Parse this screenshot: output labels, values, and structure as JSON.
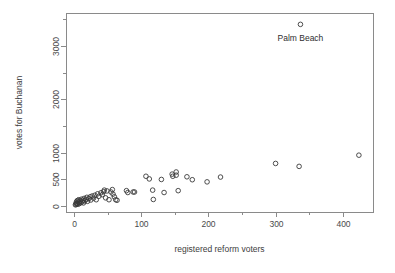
{
  "chart_data": {
    "type": "scatter",
    "title": "",
    "xlabel": "registered reform voters",
    "ylabel": "votes for Buchanan",
    "xlim": [
      -12,
      445
    ],
    "ylim": [
      -110,
      3620
    ],
    "grid": false,
    "legend": null,
    "x_ticks": [
      0,
      100,
      200,
      300,
      400
    ],
    "x_tick_labels": [
      "0",
      "100",
      "200",
      "300",
      "400"
    ],
    "x_minor_ticks": [
      50,
      150,
      250,
      350
    ],
    "y_ticks": [
      0,
      500,
      1000,
      2000,
      3000
    ],
    "y_tick_labels": [
      "0",
      "500",
      "1000",
      "2000",
      "3000"
    ],
    "y_minor_ticks": [
      1500,
      2500,
      3500
    ],
    "marker": "open-circle",
    "marker_color": "#3a3a3a",
    "annotations": [
      {
        "label": "Palm Beach",
        "x": 337,
        "y": 3407,
        "dx": 0,
        "dy": -320
      }
    ],
    "points": [
      {
        "x": 2,
        "y": 25
      },
      {
        "x": 3,
        "y": 30
      },
      {
        "x": 3,
        "y": 60
      },
      {
        "x": 4,
        "y": 45
      },
      {
        "x": 4,
        "y": 90
      },
      {
        "x": 5,
        "y": 55
      },
      {
        "x": 5,
        "y": 105
      },
      {
        "x": 6,
        "y": 35
      },
      {
        "x": 7,
        "y": 75
      },
      {
        "x": 7,
        "y": 120
      },
      {
        "x": 8,
        "y": 50
      },
      {
        "x": 9,
        "y": 95
      },
      {
        "x": 10,
        "y": 65
      },
      {
        "x": 11,
        "y": 130
      },
      {
        "x": 12,
        "y": 80
      },
      {
        "x": 13,
        "y": 110
      },
      {
        "x": 14,
        "y": 60
      },
      {
        "x": 15,
        "y": 145
      },
      {
        "x": 16,
        "y": 100
      },
      {
        "x": 18,
        "y": 125
      },
      {
        "x": 19,
        "y": 165
      },
      {
        "x": 20,
        "y": 90
      },
      {
        "x": 22,
        "y": 140
      },
      {
        "x": 24,
        "y": 175
      },
      {
        "x": 25,
        "y": 115
      },
      {
        "x": 27,
        "y": 190
      },
      {
        "x": 29,
        "y": 150
      },
      {
        "x": 31,
        "y": 205
      },
      {
        "x": 33,
        "y": 120
      },
      {
        "x": 35,
        "y": 230
      },
      {
        "x": 37,
        "y": 185
      },
      {
        "x": 40,
        "y": 250
      },
      {
        "x": 42,
        "y": 215
      },
      {
        "x": 44,
        "y": 270
      },
      {
        "x": 45,
        "y": 300
      },
      {
        "x": 47,
        "y": 155
      },
      {
        "x": 49,
        "y": 285
      },
      {
        "x": 52,
        "y": 120
      },
      {
        "x": 55,
        "y": 265
      },
      {
        "x": 57,
        "y": 310
      },
      {
        "x": 58,
        "y": 225
      },
      {
        "x": 60,
        "y": 175
      },
      {
        "x": 62,
        "y": 120
      },
      {
        "x": 64,
        "y": 110
      },
      {
        "x": 78,
        "y": 290
      },
      {
        "x": 80,
        "y": 255
      },
      {
        "x": 88,
        "y": 265
      },
      {
        "x": 90,
        "y": 265
      },
      {
        "x": 107,
        "y": 560
      },
      {
        "x": 112,
        "y": 510
      },
      {
        "x": 117,
        "y": 300
      },
      {
        "x": 118,
        "y": 125
      },
      {
        "x": 130,
        "y": 500
      },
      {
        "x": 134,
        "y": 255
      },
      {
        "x": 146,
        "y": 600
      },
      {
        "x": 147,
        "y": 560
      },
      {
        "x": 152,
        "y": 640
      },
      {
        "x": 152,
        "y": 580
      },
      {
        "x": 155,
        "y": 290
      },
      {
        "x": 168,
        "y": 550
      },
      {
        "x": 176,
        "y": 495
      },
      {
        "x": 198,
        "y": 455
      },
      {
        "x": 218,
        "y": 545
      },
      {
        "x": 300,
        "y": 800
      },
      {
        "x": 335,
        "y": 745
      },
      {
        "x": 337,
        "y": 3407
      },
      {
        "x": 424,
        "y": 955
      }
    ]
  }
}
